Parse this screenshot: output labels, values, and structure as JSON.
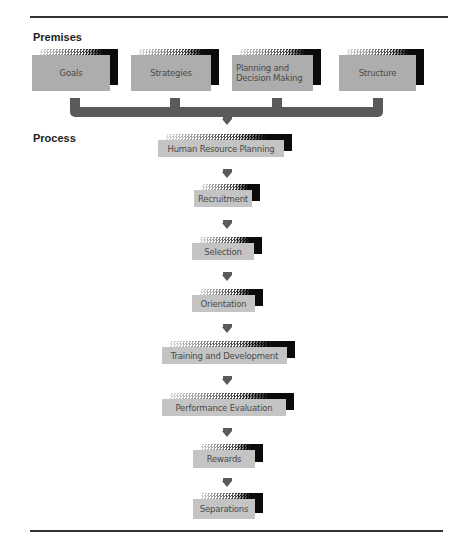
{
  "diagram": {
    "sections": {
      "premises_label": "Premises",
      "process_label": "Process"
    },
    "premises": [
      {
        "label": "Goals"
      },
      {
        "label": "Strategies"
      },
      {
        "label": "Planning and Decision Making"
      },
      {
        "label": "Structure"
      }
    ],
    "process_steps": [
      {
        "label": "Human Resource Planning"
      },
      {
        "label": "Recruitment"
      },
      {
        "label": "Selection"
      },
      {
        "label": "Orientation"
      },
      {
        "label": "Training and Development"
      },
      {
        "label": "Performance Evaluation"
      },
      {
        "label": "Rewards"
      },
      {
        "label": "Separations"
      }
    ],
    "colors": {
      "box_fill": "#b9b9b9",
      "connector": "#5a5a5a",
      "shadow": "#0b0b0b",
      "rule": "#333333"
    }
  }
}
